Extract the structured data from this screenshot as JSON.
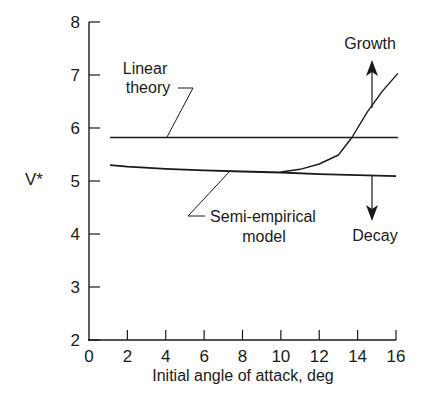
{
  "chart_data": {
    "type": "line",
    "title": "",
    "xlabel": "Initial angle of attack, deg",
    "ylabel": "V*",
    "xlim": [
      0,
      16
    ],
    "ylim": [
      2,
      8
    ],
    "xticks": [
      0,
      2,
      4,
      6,
      8,
      10,
      12,
      14,
      16
    ],
    "yticks": [
      2,
      3,
      4,
      5,
      6,
      7,
      8
    ],
    "grid": false,
    "legend": "none (inline annotations)",
    "series": [
      {
        "name": "Linear theory",
        "x": [
          1.1,
          16.1
        ],
        "y": [
          5.82,
          5.82
        ]
      },
      {
        "name": "Semi-empirical model",
        "x": [
          1.1,
          2,
          4,
          6,
          8,
          10,
          12,
          14,
          16
        ],
        "y": [
          5.3,
          5.27,
          5.23,
          5.2,
          5.18,
          5.16,
          5.13,
          5.11,
          5.09
        ]
      },
      {
        "name": "Semi-empirical model (growth branch)",
        "x": [
          10,
          11,
          12,
          13,
          13.7,
          14.5,
          15.3,
          16.1
        ],
        "y": [
          5.17,
          5.22,
          5.32,
          5.49,
          5.82,
          6.3,
          6.7,
          7.03
        ]
      }
    ],
    "annotations": [
      {
        "text": "Linear theory",
        "points_to": "Linear theory line"
      },
      {
        "text": "Semi-empirical model",
        "points_to": "Semi-empirical curve"
      },
      {
        "text": "Growth",
        "arrow": "up",
        "x": 14.7
      },
      {
        "text": "Decay",
        "arrow": "down",
        "x": 14.7
      }
    ]
  },
  "labels": {
    "ylabel": "V*",
    "xlabel": "Initial angle of attack, deg",
    "linear_line1": "Linear",
    "linear_line2": "theory",
    "semi_line1": "Semi-empirical",
    "semi_line2": "model",
    "growth": "Growth",
    "decay": "Decay"
  },
  "xtick_labels": [
    "0",
    "2",
    "4",
    "6",
    "8",
    "10",
    "12",
    "14",
    "16"
  ],
  "ytick_labels": [
    "2",
    "3",
    "4",
    "5",
    "6",
    "7",
    "8"
  ],
  "colors": {
    "ink": "#1a1a1a",
    "background": "#ffffff"
  }
}
